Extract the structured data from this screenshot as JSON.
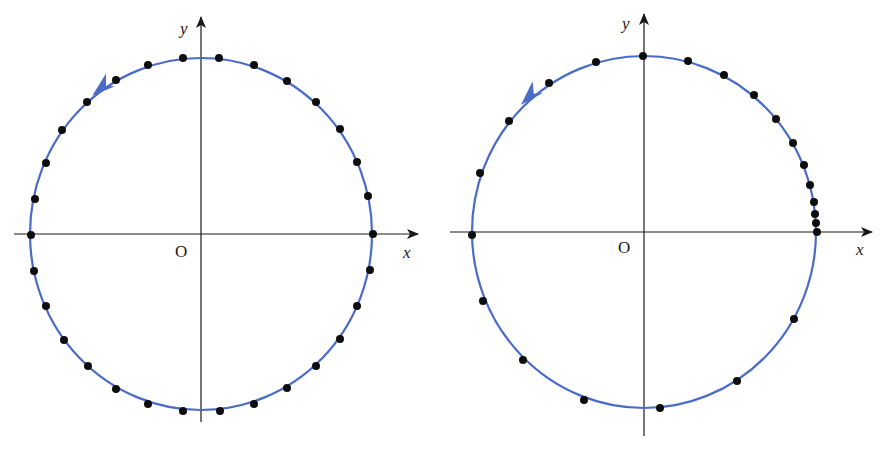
{
  "figure": {
    "curve_color": "#4a6bc7",
    "dot_color": "#0d0d0d",
    "axis_color": "#1a1a1a",
    "panels": [
      {
        "name": "uniform-circular-motion",
        "labels": {
          "x": "x",
          "y": "y",
          "origin": "O"
        },
        "center": [
          201,
          234
        ],
        "rx": 171,
        "ry": 176,
        "axis_x": [
          14,
          418
        ],
        "axis_y": [
          17,
          422
        ],
        "direction": "counterclockwise",
        "arrow_at": [
          103,
          88
        ],
        "dots": [
          [
            183,
            58
          ],
          [
            219,
            58
          ],
          [
            254,
            65
          ],
          [
            287,
            81
          ],
          [
            316,
            102
          ],
          [
            340,
            129
          ],
          [
            357,
            162
          ],
          [
            368,
            196
          ],
          [
            373,
            234
          ],
          [
            370,
            270
          ],
          [
            357,
            306
          ],
          [
            340,
            339
          ],
          [
            316,
            366
          ],
          [
            287,
            388
          ],
          [
            254,
            404
          ],
          [
            220,
            411
          ],
          [
            183,
            411
          ],
          [
            148,
            404
          ],
          [
            116,
            389
          ],
          [
            88,
            366
          ],
          [
            64,
            340
          ],
          [
            46,
            306
          ],
          [
            34,
            271
          ],
          [
            31,
            235
          ],
          [
            35,
            199
          ],
          [
            46,
            163
          ],
          [
            62,
            130
          ],
          [
            87,
            102
          ],
          [
            116,
            80
          ],
          [
            148,
            65
          ]
        ]
      },
      {
        "name": "accelerating-circular-motion",
        "labels": {
          "x": "x",
          "y": "y",
          "origin": "O"
        },
        "center": [
          644,
          232
        ],
        "rx": 172,
        "ry": 176,
        "axis_x": [
          450,
          872
        ],
        "axis_y": [
          14,
          436
        ],
        "direction": "counterclockwise",
        "arrow_at": [
          531,
          96
        ],
        "dots": [
          [
            643,
            56
          ],
          [
            688,
            61
          ],
          [
            724,
            75
          ],
          [
            754,
            95
          ],
          [
            776,
            119
          ],
          [
            793,
            143
          ],
          [
            804,
            165
          ],
          [
            810,
            185
          ],
          [
            814,
            202
          ],
          [
            815,
            214
          ],
          [
            816,
            223
          ],
          [
            817,
            232
          ],
          [
            794,
            319
          ],
          [
            737,
            381
          ],
          [
            660,
            408
          ],
          [
            584,
            400
          ],
          [
            523,
            360
          ],
          [
            483,
            301
          ],
          [
            472,
            235
          ],
          [
            480,
            173
          ],
          [
            509,
            121
          ],
          [
            549,
            83
          ],
          [
            596,
            62
          ]
        ]
      }
    ]
  }
}
